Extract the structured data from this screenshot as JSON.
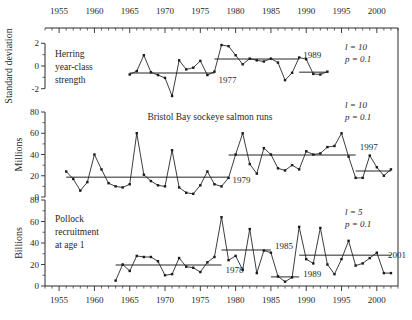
{
  "figure": {
    "width": 412,
    "height": 320,
    "background": "#ffffff",
    "ink_color": "#1a1a1a",
    "regime_color": "#6e6e6e"
  },
  "axis": {
    "x_label_top": "",
    "x_label_bottom": "",
    "x_ticks": [
      "1955",
      "1960",
      "1965",
      "1970",
      "1975",
      "1980",
      "1985",
      "1990",
      "1995",
      "2000"
    ],
    "x_tick_values": [
      1955,
      1960,
      1965,
      1970,
      1975,
      1980,
      1985,
      1990,
      1995,
      2000
    ],
    "x_min": 1953,
    "x_max": 2003,
    "minor_tick_step": 1
  },
  "chart_data": [
    {
      "type": "line",
      "panel": "top",
      "title": "",
      "series_label": "Herring year-class strength",
      "xlabel": "",
      "ylabel": "Standard deviation",
      "ylim": [
        -3,
        3
      ],
      "y_ticks": [
        -2,
        0,
        2
      ],
      "y_tick_labels": [
        "-2",
        "0",
        "2"
      ],
      "grid": false,
      "legend": "none",
      "x": [
        1965,
        1966,
        1967,
        1968,
        1969,
        1970,
        1971,
        1972,
        1973,
        1974,
        1975,
        1976,
        1977,
        1978,
        1979,
        1980,
        1981,
        1982,
        1983,
        1984,
        1985,
        1986,
        1987,
        1988,
        1989,
        1990,
        1991,
        1992,
        1993
      ],
      "values": [
        -0.75,
        -0.45,
        0.95,
        -0.55,
        -0.8,
        -1.05,
        -2.65,
        0.5,
        -0.3,
        -0.15,
        0.45,
        -0.8,
        -0.5,
        1.85,
        1.75,
        0.95,
        0.15,
        0.65,
        0.5,
        0.4,
        0.65,
        0.3,
        -1.25,
        -0.6,
        0.75,
        0.6,
        -0.7,
        -0.75,
        -0.5
      ],
      "regime_segments": [
        {
          "x_start": 1965,
          "x_end": 1977,
          "level": -0.62
        },
        {
          "x_start": 1977,
          "x_end": 1989,
          "level": 0.62
        },
        {
          "x_start": 1989,
          "x_end": 1993,
          "level": -0.55
        }
      ],
      "shift_labels": [
        {
          "text": "1977",
          "year": 1977,
          "value": -1.25
        },
        {
          "text": "1989",
          "year": 1989,
          "value": 0.95
        }
      ],
      "stats": {
        "l_label": "l = 10",
        "p_label": "p = 0.1",
        "l_value": 10,
        "p_value": 0.1
      }
    },
    {
      "type": "line",
      "panel": "middle",
      "title": "Bristol Bay sockeye salmon runs",
      "series_label": "Bristol Bay sockeye salmon runs",
      "xlabel": "",
      "ylabel": "Millions",
      "ylim": [
        0,
        80
      ],
      "y_ticks": [
        0,
        20,
        40,
        60,
        80
      ],
      "y_tick_labels": [
        "0",
        "20",
        "40",
        "60",
        "80"
      ],
      "grid": false,
      "legend": "none",
      "x": [
        1956,
        1957,
        1958,
        1959,
        1960,
        1961,
        1962,
        1963,
        1964,
        1965,
        1966,
        1967,
        1968,
        1969,
        1970,
        1971,
        1972,
        1973,
        1974,
        1975,
        1976,
        1977,
        1978,
        1979,
        1980,
        1981,
        1982,
        1983,
        1984,
        1985,
        1986,
        1987,
        1988,
        1989,
        1990,
        1991,
        1992,
        1993,
        1994,
        1995,
        1996,
        1997,
        1998,
        1999,
        2000,
        2001,
        2002
      ],
      "values": [
        24,
        17,
        6,
        14,
        40,
        26,
        13,
        10,
        9,
        12,
        60,
        21,
        15,
        11,
        10,
        44,
        9,
        4,
        3,
        11,
        24,
        12,
        10,
        18,
        40,
        60,
        31,
        22,
        46,
        40,
        27,
        25,
        30,
        26,
        43,
        40,
        41,
        47,
        48,
        60,
        38,
        18,
        18,
        39,
        28,
        20,
        26
      ],
      "regime_segments": [
        {
          "x_start": 1956,
          "x_end": 1979,
          "level": 18.5
        },
        {
          "x_start": 1979,
          "x_end": 1997,
          "level": 39.5
        },
        {
          "x_start": 1997,
          "x_end": 2002,
          "level": 24.5
        }
      ],
      "shift_labels": [
        {
          "text": "1979",
          "year": 1979,
          "value": 16
        },
        {
          "text": "1997",
          "year": 1997,
          "value": 47
        }
      ],
      "stats": {
        "l_label": "l = 10",
        "p_label": "p = 0.1",
        "l_value": 10,
        "p_value": 0.1
      }
    },
    {
      "type": "line",
      "panel": "bottom",
      "title": "",
      "series_label": "Pollock recruitment at age 1",
      "xlabel": "",
      "ylabel": "Billions",
      "ylim": [
        0,
        80
      ],
      "y_ticks": [
        0,
        20,
        40,
        60,
        80
      ],
      "y_tick_labels": [
        "0",
        "20",
        "40",
        "60",
        "80"
      ],
      "grid": false,
      "legend": "none",
      "x": [
        1963,
        1964,
        1965,
        1966,
        1967,
        1968,
        1969,
        1970,
        1971,
        1972,
        1973,
        1974,
        1975,
        1976,
        1977,
        1978,
        1979,
        1980,
        1981,
        1982,
        1983,
        1984,
        1985,
        1986,
        1987,
        1988,
        1989,
        1990,
        1991,
        1992,
        1993,
        1994,
        1995,
        1996,
        1997,
        1998,
        1999,
        2000,
        2001,
        2002
      ],
      "values": [
        5,
        20,
        14,
        28,
        27,
        27,
        23,
        10,
        11,
        26,
        18,
        17,
        13,
        22,
        27,
        64,
        24,
        28,
        15,
        53,
        12,
        33,
        31,
        9,
        4,
        8,
        55,
        25,
        21,
        54,
        20,
        11,
        25,
        42,
        19,
        21,
        26,
        31,
        12,
        12
      ],
      "regime_segments": [
        {
          "x_start": 1963,
          "x_end": 1978,
          "level": 19.5
        },
        {
          "x_start": 1978,
          "x_end": 1985,
          "level": 33.5
        },
        {
          "x_start": 1985,
          "x_end": 1989,
          "level": 8.5
        },
        {
          "x_start": 1989,
          "x_end": 2002,
          "level": 28.5
        }
      ],
      "shift_labels": [
        {
          "text": "1978",
          "year": 1978,
          "value": 15
        },
        {
          "text": "1985",
          "year": 1985,
          "value": 37
        },
        {
          "text": "1989",
          "year": 1989,
          "value": 11
        },
        {
          "text": "2001",
          "year": 2001,
          "value": 29
        }
      ],
      "stats": {
        "l_label": "l = 5",
        "p_label": "p = 0.1",
        "l_value": 5,
        "p_value": 0.1
      }
    }
  ],
  "panel_text": {
    "top_label_lines": [
      "Herring",
      "year-class",
      "strength"
    ],
    "middle_title": "Bristol Bay sockeye salmon runs",
    "bottom_label_lines": [
      "Pollock",
      "recruitment",
      "at age 1"
    ]
  }
}
